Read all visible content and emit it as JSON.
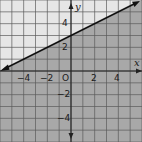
{
  "chart_data": {
    "type": "line",
    "title": "",
    "inequality": "y <= (1/2)x + 3",
    "line": {
      "slope": 0.5,
      "intercept": 3,
      "style": "solid",
      "arrows": "both"
    },
    "shaded_region": "below",
    "xlabel": "x",
    "ylabel": "y",
    "xlim": [
      -6,
      6
    ],
    "ylim": [
      -6,
      6
    ],
    "x_ticks": [
      -4,
      -2,
      2,
      4
    ],
    "y_ticks": [
      4,
      2,
      -2,
      -4
    ],
    "x_tick_labels": [
      "−4",
      "−2",
      "2",
      "4"
    ],
    "y_tick_labels": [
      "4",
      "2",
      "−2",
      "−4"
    ],
    "origin_label": "O",
    "grid": true,
    "grid_step": 1,
    "points": [
      [
        -6,
        0
      ],
      [
        0,
        3
      ],
      [
        6,
        6
      ]
    ],
    "colors": {
      "unshaded": "#e6e6e6",
      "shaded": "#a8a8a8",
      "grid": "#555555",
      "line": "#111111"
    }
  },
  "labels": {
    "x_axis": "x",
    "y_axis": "y",
    "origin": "O",
    "xt0": "−4",
    "xt1": "−2",
    "xt2": "2",
    "xt3": "4",
    "yt0": "4",
    "yt1": "2",
    "yt2": "−2",
    "yt3": "−4"
  }
}
